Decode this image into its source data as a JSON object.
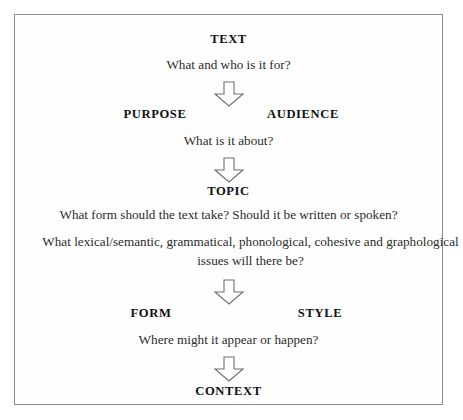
{
  "diagram": {
    "border_color": "#8c8c8c",
    "background_color": "#fefefe",
    "text_color": "#1a1a1a",
    "arrow_outline_color": "#6e6e6e",
    "arrow_fill_color": "#ffffff",
    "nodes": {
      "text": "TEXT",
      "purpose": "PURPOSE",
      "audience": "AUDIENCE",
      "topic": "TOPIC",
      "form": "FORM",
      "style": "STYLE",
      "context": "CONTEXT"
    },
    "questions": {
      "q1": "What and who is it for?",
      "q2": "What is it about?",
      "q3": "What form should the text take? Should it be written or spoken?",
      "q4": "What lexical/semantic, grammatical, phonological, cohesive and graphological issues will there be?",
      "q5": "Where might it appear or happen?"
    },
    "arrows": {
      "arrow1": "down-arrow",
      "arrow2": "down-arrow",
      "arrow3": "down-arrow",
      "arrow4": "down-arrow"
    }
  }
}
